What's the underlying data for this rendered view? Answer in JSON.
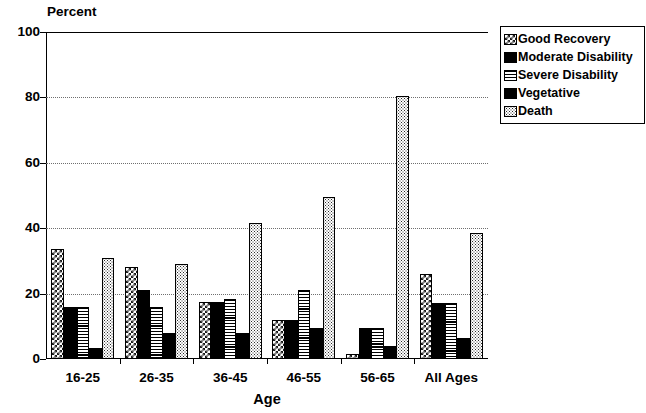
{
  "chart_data": {
    "type": "bar",
    "title": "",
    "xlabel": "Age",
    "ylabel": "Percent",
    "ylim": [
      0,
      100
    ],
    "yticks": [
      0,
      20,
      40,
      60,
      80,
      100
    ],
    "grid": true,
    "legend_position": "right",
    "categories": [
      "16-25",
      "26-35",
      "36-45",
      "46-55",
      "56-65",
      "All Ages"
    ],
    "series": [
      {
        "name": "Good Recovery",
        "pattern": "checker",
        "values": [
          33.5,
          28.0,
          17.5,
          12.0,
          1.5,
          26.0
        ]
      },
      {
        "name": "Moderate Disability",
        "pattern": "solid",
        "values": [
          16.0,
          21.0,
          17.5,
          12.0,
          9.5,
          17.0
        ]
      },
      {
        "name": "Severe Disability",
        "pattern": "hlines",
        "values": [
          16.0,
          16.0,
          18.5,
          21.0,
          9.5,
          17.0
        ]
      },
      {
        "name": "Vegetative",
        "pattern": "solid",
        "values": [
          3.5,
          8.0,
          8.0,
          9.5,
          4.0,
          6.5
        ]
      },
      {
        "name": "Death",
        "pattern": "stipple",
        "values": [
          31.0,
          29.0,
          41.5,
          49.5,
          80.5,
          38.5
        ]
      }
    ]
  },
  "axes": {
    "y_title": "Percent",
    "x_title": "Age",
    "y_tick_labels": [
      "0",
      "20",
      "40",
      "60",
      "80",
      "100"
    ],
    "x_tick_labels": [
      "16-25",
      "26-35",
      "36-45",
      "46-55",
      "56-65",
      "All Ages"
    ]
  },
  "legend": {
    "items": [
      {
        "label": "Good Recovery"
      },
      {
        "label": "Moderate Disability"
      },
      {
        "label": "Severe Disability"
      },
      {
        "label": "Vegetative"
      },
      {
        "label": "Death"
      }
    ]
  },
  "colors": {
    "ink": "#000000",
    "background": "#ffffff",
    "gridline": "#6f6f6f"
  }
}
